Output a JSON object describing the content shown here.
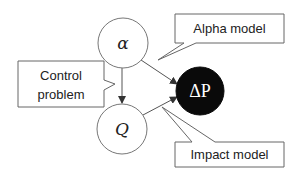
{
  "diagram": {
    "nodes": [
      {
        "id": "alpha",
        "label": "α",
        "fill": "#ffffff",
        "stroke": "#777777",
        "cx": 123,
        "cy": 43,
        "r": 25
      },
      {
        "id": "Q",
        "label": "Q",
        "fill": "#ffffff",
        "stroke": "#777777",
        "cx": 122,
        "cy": 129,
        "r": 25
      },
      {
        "id": "deltaP",
        "label": "ΔP",
        "fill": "#0a0a0a",
        "stroke": "#0a0a0a",
        "cx": 200,
        "cy": 91,
        "r": 24
      }
    ],
    "edges": [
      {
        "from": "alpha",
        "to": "Q",
        "arrow": true
      },
      {
        "from": "alpha",
        "to": "deltaP",
        "arrow": true
      },
      {
        "from": "Q",
        "to": "deltaP",
        "arrow": true
      }
    ],
    "callouts": {
      "alpha_model": {
        "text": "Alpha model"
      },
      "control_problem": {
        "line1": "Control",
        "line2": "problem"
      },
      "impact_model": {
        "text": "Impact model"
      }
    },
    "colors": {
      "line": "#555555",
      "box_stroke": "#666666",
      "dark_node": "#0a0a0a"
    }
  }
}
